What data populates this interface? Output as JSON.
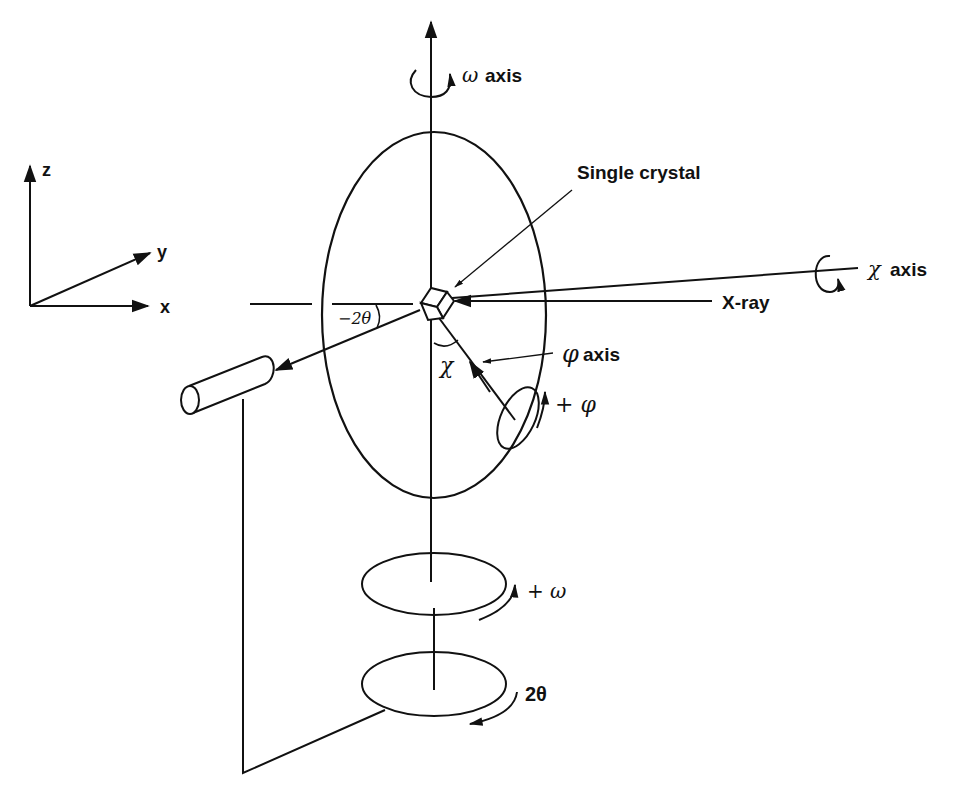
{
  "diagram": {
    "type": "four-circle single-crystal diffractometer geometry",
    "coordinate_system": {
      "axes": [
        {
          "name": "z",
          "label": "z"
        },
        {
          "name": "y",
          "label": "y"
        },
        {
          "name": "x",
          "label": "x"
        }
      ]
    },
    "labels": {
      "omega_axis_symbol": "ω",
      "omega_axis_text": "axis",
      "single_crystal": "Single crystal",
      "chi_axis_symbol": "χ",
      "chi_axis_text": "axis",
      "xray": "X-ray",
      "phi_axis_symbol": "φ",
      "phi_axis_text": "axis",
      "minus_two_theta": "−2θ",
      "chi_angle": "χ",
      "plus_phi": "+ φ",
      "plus_omega": "+ ω",
      "two_theta": "2θ"
    },
    "components": [
      {
        "id": "omega-axis",
        "description": "vertical rotation axis with arrow upward"
      },
      {
        "id": "chi-circle",
        "description": "large vertical ellipse (Eulerian cradle)"
      },
      {
        "id": "crystal",
        "description": "cube at center of circles"
      },
      {
        "id": "xray-beam",
        "description": "incident beam from right"
      },
      {
        "id": "detector",
        "description": "cylindrical detector on 2θ arm"
      },
      {
        "id": "phi-circle",
        "description": "small ellipse on chi circle"
      },
      {
        "id": "omega-circle",
        "description": "horizontal ellipse on vertical axis"
      },
      {
        "id": "two-theta-circle",
        "description": "lower horizontal ellipse carrying detector arm"
      }
    ]
  }
}
